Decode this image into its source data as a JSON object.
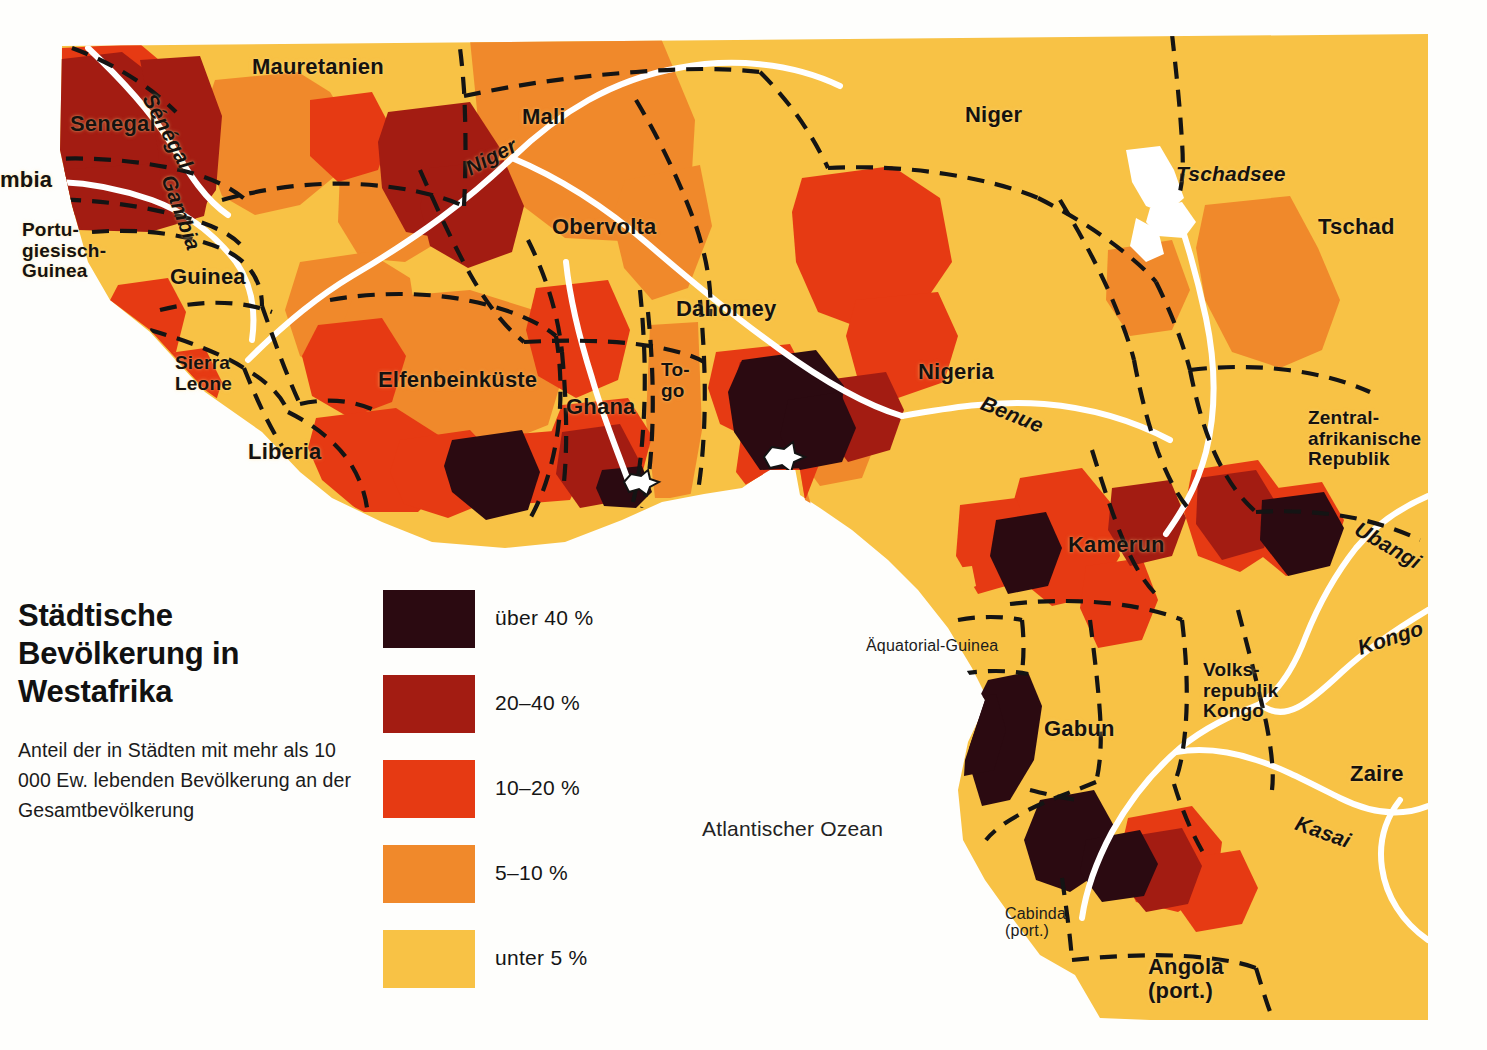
{
  "title": "Städtische\nBevölkerung\nin Westafrika",
  "subtitle": "Anteil der in Städten mit mehr\nals 10 000 Ew. lebenden\nBevölkerung an\nder Gesamtbevölkerung",
  "legend": {
    "items": [
      {
        "label": "über 40 %",
        "color": "#2b0a11",
        "range": "over-40"
      },
      {
        "label": "20–40 %",
        "color": "#a31c12",
        "range": "20-40"
      },
      {
        "label": "10–20 %",
        "color": "#e63a13",
        "range": "10-20"
      },
      {
        "label": "5–10 %",
        "color": "#f0892b",
        "range": "5-10"
      },
      {
        "label": "unter 5 %",
        "color": "#f8c245",
        "range": "under-5"
      }
    ]
  },
  "map": {
    "base_color": "#f8c245",
    "ocean_color": "#ffffff",
    "border_color": "#141414",
    "river_color": "#ffffff",
    "ocean_label": "Atlantischer Ozean",
    "countries": [
      {
        "name": "Mauretanien",
        "x": 252,
        "y": 55,
        "class": "country"
      },
      {
        "name": "Senegal",
        "x": 70,
        "y": 112,
        "class": "country"
      },
      {
        "name": "mbia",
        "x": 0,
        "y": 168,
        "class": "country"
      },
      {
        "name": "Portu-\ngiesisch-\nGuinea",
        "x": 22,
        "y": 220,
        "class": "small"
      },
      {
        "name": "Guinea",
        "x": 170,
        "y": 265,
        "class": "country"
      },
      {
        "name": "Sierra\nLeone",
        "x": 175,
        "y": 353,
        "class": "small"
      },
      {
        "name": "Liberia",
        "x": 248,
        "y": 440,
        "class": "country"
      },
      {
        "name": "Elfenbeinküste",
        "x": 378,
        "y": 368,
        "class": "country"
      },
      {
        "name": "Ghana",
        "x": 566,
        "y": 395,
        "class": "country"
      },
      {
        "name": "To-\ngo",
        "x": 661,
        "y": 360,
        "class": "small"
      },
      {
        "name": "Mali",
        "x": 522,
        "y": 105,
        "class": "country"
      },
      {
        "name": "Obervolta",
        "x": 552,
        "y": 215,
        "class": "country"
      },
      {
        "name": "Dahomey",
        "x": 676,
        "y": 297,
        "class": "country"
      },
      {
        "name": "Niger",
        "x": 965,
        "y": 103,
        "class": "country"
      },
      {
        "name": "Nigeria",
        "x": 918,
        "y": 360,
        "class": "country"
      },
      {
        "name": "Tschad",
        "x": 1318,
        "y": 215,
        "class": "country"
      },
      {
        "name": "Kamerun",
        "x": 1068,
        "y": 533,
        "class": "country"
      },
      {
        "name": "Zentral-\nafrikanische\nRepublik",
        "x": 1308,
        "y": 408,
        "class": "small"
      },
      {
        "name": "Äquatorial-Guinea",
        "x": 866,
        "y": 637,
        "class": "plainlbl"
      },
      {
        "name": "Gabun",
        "x": 1044,
        "y": 717,
        "class": "country"
      },
      {
        "name": "Volks-\nrepublik\nKongo",
        "x": 1203,
        "y": 660,
        "class": "small"
      },
      {
        "name": "Zaire",
        "x": 1350,
        "y": 762,
        "class": "country"
      },
      {
        "name": "Cabinda\n(port.)",
        "x": 1005,
        "y": 905,
        "class": "plainlbl"
      },
      {
        "name": "Angola\n(port.)",
        "x": 1148,
        "y": 955,
        "class": "country"
      }
    ],
    "waters": [
      {
        "name": "Tschadsee",
        "x": 1176,
        "y": 163,
        "rot": 0,
        "class": "river"
      },
      {
        "name": "Sénégal",
        "x": 158,
        "y": 90,
        "rot": 62,
        "class": "river"
      },
      {
        "name": "Gambia",
        "x": 178,
        "y": 172,
        "rot": 70,
        "class": "river"
      },
      {
        "name": "Niger",
        "x": 462,
        "y": 160,
        "rot": -28,
        "class": "river"
      },
      {
        "name": "Benue",
        "x": 986,
        "y": 392,
        "rot": 22,
        "class": "river"
      },
      {
        "name": "Ubangi",
        "x": 1362,
        "y": 518,
        "rot": 30,
        "class": "river"
      },
      {
        "name": "Kongo",
        "x": 1355,
        "y": 638,
        "rot": -18,
        "class": "river"
      },
      {
        "name": "Kasai",
        "x": 1300,
        "y": 812,
        "rot": 20,
        "class": "river"
      }
    ]
  }
}
